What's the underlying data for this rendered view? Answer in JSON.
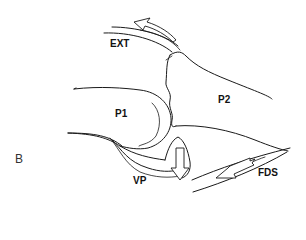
{
  "figure": {
    "panel_label": "B",
    "labels": {
      "ext": "EXT",
      "p1": "P1",
      "p2": "P2",
      "vp": "VP",
      "fds": "FDS"
    },
    "colors": {
      "stroke": "#1a1a1a",
      "background": "#ffffff",
      "arrow_fill": "#ffffff"
    },
    "arrows": [
      {
        "name": "extensor-tendon-arrow",
        "direction": "proximal-dorsal"
      },
      {
        "name": "volar-plate-arrow",
        "direction": "down"
      },
      {
        "name": "flexor-tendon-arrow",
        "direction": "proximal-volar"
      }
    ]
  }
}
